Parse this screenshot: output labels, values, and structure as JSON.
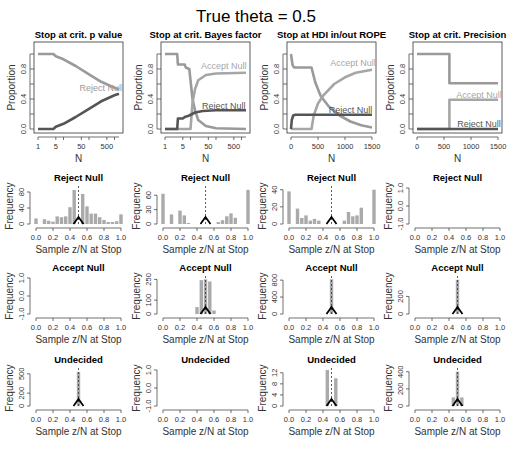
{
  "chart_data": {
    "title": "True theta = 0.5",
    "colors": {
      "accept": "#a6a6a6",
      "reject": "#555555",
      "undecided": "#9a9a9a",
      "bar": "#aaaaaa",
      "axis": "#333333"
    },
    "top_row": [
      {
        "type": "line",
        "title": "Stop at crit. p value",
        "xlabel": "N",
        "ylabel": "Proportion",
        "xscale": "log",
        "xlim": [
          1,
          1500
        ],
        "ylim": [
          0,
          1
        ],
        "xticks": [
          1,
          5,
          50,
          500
        ],
        "xtick_labels": [
          "1",
          "5",
          "50",
          "500"
        ],
        "yticks": [
          0,
          0.4,
          0.8
        ],
        "ytick_labels": [
          "0.0",
          "0.4",
          "0.8"
        ],
        "series": [
          {
            "name": "Undecided",
            "color_key": "undecided",
            "points": [
              [
                1,
                1
              ],
              [
                4,
                1
              ],
              [
                5,
                0.97
              ],
              [
                10,
                0.93
              ],
              [
                30,
                0.84
              ],
              [
                100,
                0.73
              ],
              [
                300,
                0.63
              ],
              [
                1000,
                0.55
              ],
              [
                1500,
                0.53
              ]
            ]
          },
          {
            "name": "Reject Null",
            "color_key": "reject",
            "points": [
              [
                1,
                0
              ],
              [
                4,
                0
              ],
              [
                5,
                0.03
              ],
              [
                10,
                0.07
              ],
              [
                30,
                0.16
              ],
              [
                100,
                0.27
              ],
              [
                300,
                0.37
              ],
              [
                1000,
                0.45
              ],
              [
                1500,
                0.47
              ]
            ]
          }
        ],
        "annotations": [
          {
            "text": "Reject Null",
            "x": 300,
            "y": 0.55,
            "color_key": "undecided"
          }
        ]
      },
      {
        "type": "line",
        "title": "Stop at crit. Bayes factor",
        "xlabel": "N",
        "ylabel": "Proportion",
        "xscale": "log",
        "xlim": [
          1,
          1500
        ],
        "ylim": [
          0,
          1
        ],
        "xticks": [
          1,
          5,
          50,
          500
        ],
        "xtick_labels": [
          "1",
          "5",
          "50",
          "500"
        ],
        "yticks": [
          0,
          0.4,
          0.8
        ],
        "ytick_labels": [
          "0.0",
          "0.4",
          "0.8"
        ],
        "series": [
          {
            "name": "Undecided",
            "color_key": "undecided",
            "points": [
              [
                1,
                1
              ],
              [
                3,
                1
              ],
              [
                3.2,
                0.86
              ],
              [
                6,
                0.86
              ],
              [
                6.5,
                0.82
              ],
              [
                9,
                0.8
              ],
              [
                12,
                0.4
              ],
              [
                15,
                0.25
              ],
              [
                20,
                0.12
              ],
              [
                40,
                0.04
              ],
              [
                100,
                0.01
              ],
              [
                1500,
                0
              ]
            ]
          },
          {
            "name": "Accept Null",
            "color_key": "accept",
            "points": [
              [
                1,
                0
              ],
              [
                10,
                0
              ],
              [
                12,
                0.35
              ],
              [
                15,
                0.53
              ],
              [
                20,
                0.65
              ],
              [
                40,
                0.72
              ],
              [
                100,
                0.74
              ],
              [
                1500,
                0.75
              ]
            ]
          },
          {
            "name": "Reject Null",
            "color_key": "reject",
            "points": [
              [
                1,
                0
              ],
              [
                3,
                0
              ],
              [
                3.2,
                0.14
              ],
              [
                5,
                0.14
              ],
              [
                6,
                0.16
              ],
              [
                9,
                0.18
              ],
              [
                15,
                0.22
              ],
              [
                30,
                0.24
              ],
              [
                100,
                0.25
              ],
              [
                1500,
                0.25
              ]
            ]
          }
        ],
        "annotations": [
          {
            "text": "Accept Null",
            "x": 200,
            "y": 0.84,
            "color_key": "accept"
          },
          {
            "text": "Reject Null",
            "x": 200,
            "y": 0.31,
            "color_key": "reject"
          }
        ]
      },
      {
        "type": "line",
        "title": "Stop at HDI in/out ROPE",
        "xlabel": "N",
        "ylabel": "Proportion",
        "xscale": "linear",
        "xlim": [
          0,
          1500
        ],
        "ylim": [
          0,
          1
        ],
        "xticks": [
          0,
          500,
          1000,
          1500
        ],
        "xtick_labels": [
          "0",
          "500",
          "1000",
          "1500"
        ],
        "yticks": [
          0,
          0.4,
          0.8
        ],
        "ytick_labels": [
          "0.0",
          "0.4",
          "0.8"
        ],
        "series": [
          {
            "name": "Undecided",
            "color_key": "undecided",
            "points": [
              [
                0,
                1
              ],
              [
                30,
                0.85
              ],
              [
                60,
                0.82
              ],
              [
                380,
                0.82
              ],
              [
                450,
                0.62
              ],
              [
                550,
                0.44
              ],
              [
                700,
                0.3
              ],
              [
                900,
                0.18
              ],
              [
                1100,
                0.1
              ],
              [
                1300,
                0.05
              ],
              [
                1500,
                0.02
              ]
            ]
          },
          {
            "name": "Accept Null",
            "color_key": "accept",
            "points": [
              [
                0,
                0
              ],
              [
                380,
                0
              ],
              [
                420,
                0.18
              ],
              [
                500,
                0.34
              ],
              [
                600,
                0.45
              ],
              [
                800,
                0.6
              ],
              [
                1000,
                0.69
              ],
              [
                1200,
                0.75
              ],
              [
                1500,
                0.79
              ]
            ]
          },
          {
            "name": "Reject Null",
            "color_key": "reject",
            "points": [
              [
                0,
                0
              ],
              [
                15,
                0.12
              ],
              [
                40,
                0.18
              ],
              [
                80,
                0.19
              ],
              [
                200,
                0.19
              ],
              [
                1500,
                0.19
              ]
            ]
          }
        ],
        "annotations": [
          {
            "text": "Accept Null",
            "x": 1150,
            "y": 0.88,
            "color_key": "accept"
          },
          {
            "text": "Reject Null",
            "x": 1100,
            "y": 0.25,
            "color_key": "reject"
          }
        ]
      },
      {
        "type": "line",
        "title": "Stop at crit. Precision",
        "xlabel": "N",
        "ylabel": "Proportion",
        "xscale": "linear",
        "xlim": [
          0,
          1500
        ],
        "ylim": [
          0,
          1
        ],
        "xticks": [
          0,
          500,
          1000,
          1500
        ],
        "xtick_labels": [
          "0",
          "500",
          "1000",
          "1500"
        ],
        "yticks": [
          0,
          0.4,
          0.8
        ],
        "ytick_labels": [
          "0.0",
          "0.4",
          "0.8"
        ],
        "series": [
          {
            "name": "Undecided",
            "color_key": "undecided",
            "points": [
              [
                0,
                1
              ],
              [
                600,
                1
              ],
              [
                600,
                0.61
              ],
              [
                1500,
                0.61
              ]
            ]
          },
          {
            "name": "Accept Null",
            "color_key": "accept",
            "points": [
              [
                0,
                0
              ],
              [
                600,
                0
              ],
              [
                600,
                0.39
              ],
              [
                1500,
                0.39
              ]
            ]
          },
          {
            "name": "Reject Null",
            "color_key": "reject",
            "points": [
              [
                0,
                0
              ],
              [
                1500,
                0
              ]
            ]
          }
        ],
        "annotations": [
          {
            "text": "Accept Null",
            "x": 1150,
            "y": 0.45,
            "color_key": "accept"
          },
          {
            "text": "Reject Null",
            "x": 1150,
            "y": 0.07,
            "color_key": "reject"
          }
        ]
      }
    ],
    "histograms": [
      {
        "row": "Reject Null",
        "col": 0,
        "title": "Reject Null",
        "ylim": [
          0,
          90
        ],
        "yticks": [
          0,
          40,
          80
        ],
        "ytick_labels": [
          "0",
          "40",
          "80"
        ],
        "empty": false,
        "bars": [
          [
            0.0,
            14
          ],
          [
            0.1,
            12
          ],
          [
            0.15,
            8
          ],
          [
            0.2,
            6
          ],
          [
            0.25,
            19
          ],
          [
            0.3,
            17
          ],
          [
            0.35,
            19
          ],
          [
            0.4,
            42
          ],
          [
            0.45,
            85
          ],
          [
            0.55,
            75
          ],
          [
            0.6,
            44
          ],
          [
            0.65,
            26
          ],
          [
            0.7,
            26
          ],
          [
            0.75,
            17
          ],
          [
            0.8,
            10
          ],
          [
            0.85,
            5
          ],
          [
            0.9,
            5
          ],
          [
            0.95,
            7
          ],
          [
            1.0,
            24
          ]
        ]
      },
      {
        "row": "Reject Null",
        "col": 1,
        "title": "Reject Null",
        "ylim": [
          0,
          75
        ],
        "yticks": [
          0,
          30,
          60
        ],
        "ytick_labels": [
          "0",
          "30",
          "60"
        ],
        "empty": false,
        "bars": [
          [
            0.0,
            63
          ],
          [
            0.1,
            20
          ],
          [
            0.2,
            28
          ],
          [
            0.25,
            18
          ],
          [
            0.3,
            2
          ],
          [
            0.65,
            4
          ],
          [
            0.7,
            8
          ],
          [
            0.75,
            16
          ],
          [
            0.8,
            22
          ],
          [
            0.85,
            13
          ],
          [
            1.0,
            71
          ]
        ]
      },
      {
        "row": "Reject Null",
        "col": 2,
        "title": "Reject Null",
        "ylim": [
          0,
          42
        ],
        "yticks": [
          0,
          20,
          40
        ],
        "ytick_labels": [
          "0",
          "20",
          "40"
        ],
        "empty": false,
        "bars": [
          [
            0.0,
            38
          ],
          [
            0.1,
            18
          ],
          [
            0.15,
            7
          ],
          [
            0.2,
            10
          ],
          [
            0.25,
            4
          ],
          [
            0.3,
            6
          ],
          [
            0.35,
            4
          ],
          [
            0.65,
            4
          ],
          [
            0.7,
            14
          ],
          [
            0.75,
            9
          ],
          [
            0.8,
            10
          ],
          [
            0.85,
            19
          ],
          [
            1.0,
            40
          ]
        ]
      },
      {
        "row": "Reject Null",
        "col": 3,
        "title": "Reject Null",
        "ylim": [
          -1,
          1
        ],
        "yticks": [
          -1,
          0,
          1
        ],
        "ytick_labels": [
          "-1.0",
          "0.0",
          "1.0"
        ],
        "empty": true,
        "bars": []
      },
      {
        "row": "Accept Null",
        "col": 0,
        "title": "Accept Null",
        "ylim": [
          -1,
          1
        ],
        "yticks": [
          -1,
          0,
          1
        ],
        "ytick_labels": [
          "-1.0",
          "0.0",
          "1.0"
        ],
        "empty": true,
        "bars": []
      },
      {
        "row": "Accept Null",
        "col": 1,
        "title": "Accept Null",
        "ylim": [
          0,
          260
        ],
        "yticks": [
          0,
          100,
          250
        ],
        "ytick_labels": [
          "0",
          "100",
          "250"
        ],
        "empty": false,
        "bars": [
          [
            0.4,
            50
          ],
          [
            0.45,
            245
          ],
          [
            0.5,
            250
          ],
          [
            0.55,
            235
          ],
          [
            0.6,
            25
          ]
        ]
      },
      {
        "row": "Accept Null",
        "col": 2,
        "title": "Accept Null",
        "ylim": [
          0,
          850
        ],
        "yticks": [
          0,
          400,
          800
        ],
        "ytick_labels": [
          "0",
          "400",
          "800"
        ],
        "empty": false,
        "bars": [
          [
            0.5,
            820
          ]
        ]
      },
      {
        "row": "Accept Null",
        "col": 3,
        "title": "Accept Null",
        "ylim": [
          0,
          410
        ],
        "yticks": [
          0,
          200
        ],
        "ytick_labels": [
          "0",
          "200"
        ],
        "empty": false,
        "bars": [
          [
            0.5,
            390
          ]
        ]
      },
      {
        "row": "Undecided",
        "col": 0,
        "title": "Undecided",
        "ylim": [
          0,
          560
        ],
        "yticks": [
          0,
          200,
          500
        ],
        "ytick_labels": [
          "0",
          "200",
          "500"
        ],
        "empty": false,
        "bars": [
          [
            0.5,
            530
          ]
        ]
      },
      {
        "row": "Undecided",
        "col": 1,
        "title": "Undecided",
        "ylim": [
          -1,
          1
        ],
        "yticks": [
          -1,
          0,
          1
        ],
        "ytick_labels": [
          "-1.0",
          "0.0",
          "1.0"
        ],
        "empty": true,
        "bars": []
      },
      {
        "row": "Undecided",
        "col": 2,
        "title": "Undecided",
        "ylim": [
          0,
          13
        ],
        "yticks": [
          0,
          4,
          8,
          12
        ],
        "ytick_labels": [
          "0",
          "4",
          "8",
          "12"
        ],
        "empty": false,
        "bars": [
          [
            0.45,
            13
          ],
          [
            0.55,
            10
          ]
        ]
      },
      {
        "row": "Undecided",
        "col": 3,
        "title": "Undecided",
        "ylim": [
          0,
          420
        ],
        "yticks": [
          0,
          200,
          400
        ],
        "ytick_labels": [
          "0",
          "200",
          "400"
        ],
        "empty": false,
        "bars": [
          [
            0.45,
            100
          ],
          [
            0.5,
            400
          ],
          [
            0.55,
            100
          ]
        ]
      }
    ],
    "hist_common": {
      "xlabel": "Sample z/N at Stop",
      "ylabel": "Frequency",
      "xlim": [
        0,
        1
      ],
      "xticks": [
        0,
        0.2,
        0.4,
        0.6,
        0.8,
        1.0
      ],
      "xtick_labels": [
        "0.0",
        "0.2",
        "0.4",
        "0.6",
        "0.8",
        "1.0"
      ],
      "true_theta": 0.5,
      "bin_width": 0.05
    }
  }
}
